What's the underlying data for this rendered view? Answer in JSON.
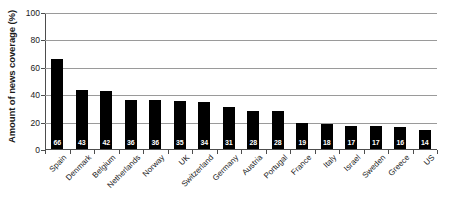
{
  "chart_data": {
    "type": "bar",
    "title": "",
    "subtitle": "",
    "xlabel": "",
    "ylabel": "Amount of news coverage (%)",
    "ylim": [
      0,
      100
    ],
    "yticks": [
      0,
      20,
      40,
      60,
      80,
      100
    ],
    "ytick_labels": [
      "0",
      "20",
      "40",
      "60",
      "80",
      "100"
    ],
    "grid": "horizontal",
    "legend": "none",
    "bar_color": "#000000",
    "value_label_color": "#ffffff",
    "gridline_color": "#9a9a9a",
    "axis_color": "#4d4d4d",
    "background": "#ffffff",
    "categories": [
      "Spain",
      "Denmark",
      "Belgium",
      "Netherlands",
      "Norway",
      "UK",
      "Switzerland",
      "Germany",
      "Austria",
      "Portugal",
      "France",
      "Italy",
      "Israel",
      "Sweden",
      "Greece",
      "US"
    ],
    "values": [
      66,
      43,
      42,
      36,
      36,
      35,
      34,
      31,
      28,
      28,
      19,
      18,
      17,
      17,
      16,
      14
    ],
    "value_labels": [
      "66",
      "43",
      "42",
      "36",
      "36",
      "35",
      "34",
      "31",
      "28",
      "28",
      "19",
      "18",
      "17",
      "17",
      "16",
      "14"
    ]
  }
}
